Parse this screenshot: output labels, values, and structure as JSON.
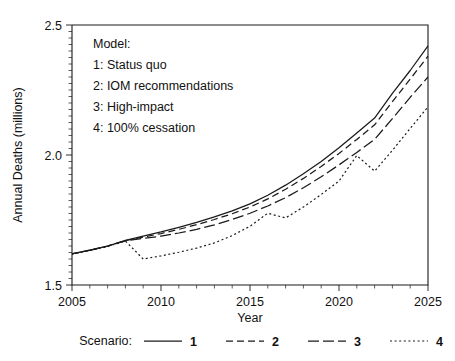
{
  "chart_data": {
    "type": "line",
    "title": "",
    "xlabel": "Year",
    "ylabel": "Annual Deaths (millions)",
    "xlim": [
      2005,
      2025
    ],
    "ylim": [
      1.5,
      2.5
    ],
    "xticks": [
      2005,
      2010,
      2015,
      2020,
      2025
    ],
    "yticks": [
      1.5,
      2.0,
      2.5
    ],
    "ytick_labels": [
      "1.5",
      "2.0",
      "2.5"
    ],
    "xtick_labels": [
      "2005",
      "2010",
      "2015",
      "2020",
      "2025"
    ],
    "x_minor_tick_step": 1,
    "y_minor_tick_step": 0.025,
    "grid": false,
    "legend_position": "below-axes",
    "x": [
      2005,
      2006,
      2007,
      2008,
      2009,
      2010,
      2011,
      2012,
      2013,
      2014,
      2015,
      2016,
      2017,
      2018,
      2019,
      2020,
      2021,
      2022,
      2023,
      2024,
      2025
    ],
    "series": [
      {
        "name": "1",
        "label": "Status quo",
        "style": "solid",
        "values": [
          1.62,
          1.634,
          1.65,
          1.672,
          1.688,
          1.704,
          1.722,
          1.741,
          1.762,
          1.785,
          1.812,
          1.845,
          1.884,
          1.928,
          1.975,
          2.028,
          2.085,
          2.142,
          2.237,
          2.325,
          2.42
        ]
      },
      {
        "name": "2",
        "label": "IOM recommendations",
        "style": "dashed",
        "values": [
          1.62,
          1.634,
          1.65,
          1.671,
          1.684,
          1.698,
          1.714,
          1.732,
          1.752,
          1.774,
          1.8,
          1.831,
          1.868,
          1.91,
          1.956,
          2.006,
          2.06,
          2.116,
          2.205,
          2.292,
          2.38
        ]
      },
      {
        "name": "3",
        "label": "High-impact",
        "style": "longdash",
        "values": [
          1.62,
          1.633,
          1.649,
          1.67,
          1.679,
          1.688,
          1.7,
          1.714,
          1.731,
          1.752,
          1.776,
          1.804,
          1.836,
          1.874,
          1.916,
          1.962,
          2.01,
          2.06,
          2.14,
          2.222,
          2.3
        ]
      },
      {
        "name": "4",
        "label": "100% cessation",
        "style": "dotted",
        "values": [
          1.62,
          1.633,
          1.648,
          1.669,
          1.6,
          1.612,
          1.626,
          1.642,
          1.662,
          1.69,
          1.726,
          1.776,
          1.758,
          1.8,
          1.848,
          1.9,
          1.998,
          1.938,
          2.018,
          2.102,
          2.185
        ]
      }
    ],
    "annotations": {
      "model_box_title": "Model:",
      "model_box_entries": [
        "1: Status quo",
        "2: IOM recommendations",
        "3: High-impact",
        "4: 100% cessation"
      ]
    }
  },
  "legend": {
    "title": "Scenario:",
    "entries": [
      {
        "label": "1",
        "style": "solid"
      },
      {
        "label": "2",
        "style": "dashed"
      },
      {
        "label": "3",
        "style": "longdash"
      },
      {
        "label": "4",
        "style": "dotted"
      }
    ]
  },
  "colors": {
    "line": "#1a1a1a",
    "axis": "#1a1a1a",
    "background": "#ffffff",
    "text": "#111111"
  }
}
